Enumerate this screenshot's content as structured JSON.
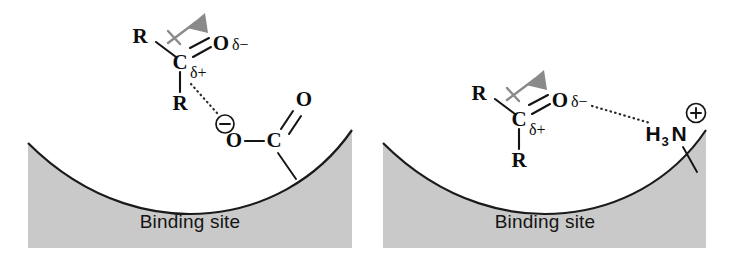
{
  "figure": {
    "panel_count": 2,
    "background_color": "#ffffff",
    "surface_fill_color": "#c9c9c9",
    "surface_edge_color": "#1a1a1a",
    "dipole_arrow_color": "#8a8a8a",
    "text_color": "#0d0d0d"
  },
  "panels": [
    {
      "id": "left",
      "caption": "Binding site",
      "interaction_type": "ion-dipole",
      "ligand": {
        "name": "ketone-carbonyl",
        "atoms": {
          "r_top": "R",
          "r_bottom": "R",
          "carbon": "C",
          "oxygen": "O"
        },
        "charges": {
          "oxygen_partial": "δ−",
          "carbon_partial": "δ+"
        },
        "dipole_label": "dipole-moment-arrow"
      },
      "binding_group": {
        "name": "carboxylate",
        "atoms": {
          "oxygen_anion": "O",
          "carbon": "C",
          "oxygen_carbonyl": "O"
        },
        "charge": "−",
        "charge_symbol_name": "circled-minus"
      },
      "bond_label": "ionic-dotted-interaction"
    },
    {
      "id": "right",
      "caption": "Binding site",
      "interaction_type": "hydrogen-bond",
      "ligand": {
        "name": "ketone-carbonyl",
        "atoms": {
          "r_top": "R",
          "r_bottom": "R",
          "carbon": "C",
          "oxygen": "O"
        },
        "charges": {
          "oxygen_partial": "δ−",
          "carbon_partial": "δ+"
        },
        "dipole_label": "dipole-moment-arrow"
      },
      "binding_group": {
        "name": "ammonium",
        "formula_main": "H",
        "formula_sub": "3",
        "formula_element": "N",
        "charge": "+",
        "charge_symbol_name": "circled-plus"
      },
      "bond_label": "hydrogen-bond-dotted"
    }
  ]
}
